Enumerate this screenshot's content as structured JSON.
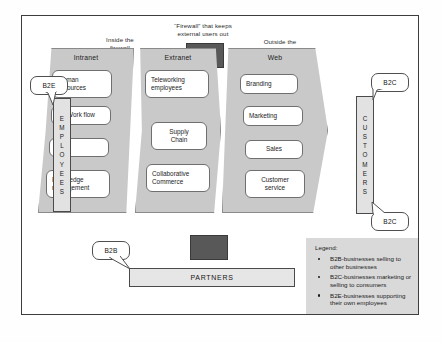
{
  "diagram": {
    "captions": {
      "inside": "Inside the\nfirewall",
      "inside_line1": "Inside the",
      "inside_line2": "firewall",
      "firewall_line1": "“Firewall” that keeps",
      "firewall_line2": "external users out",
      "outside_line1": "Outside the",
      "outside_line2": "firewall"
    },
    "columns": [
      {
        "id": "intranet",
        "title": "Intranet",
        "nodes": [
          "Human\nresources",
          "Work flow",
          "CRM",
          "Knowledge\nmanagement"
        ]
      },
      {
        "id": "extranet",
        "title": "Extranet",
        "nodes": [
          "Teleworking\nemployees",
          "Supply\nChain",
          "Collaborative\nCommerce"
        ]
      },
      {
        "id": "web",
        "title": "Web",
        "nodes": [
          "Branding",
          "Marketing",
          "Sales",
          "Customer\nservice"
        ]
      }
    ],
    "column_nodes": {
      "intranet": [
        {
          "line1": "Human",
          "line2": "resources"
        },
        {
          "line1": "Work flow",
          "line2": ""
        },
        {
          "line1": "CRM",
          "line2": ""
        },
        {
          "line1": "Knowledge",
          "line2": "management"
        }
      ],
      "extranet": [
        {
          "line1": "Teleworking",
          "line2": "employees"
        },
        {
          "line1": "Supply",
          "line2": "Chain"
        },
        {
          "line1": "Collaborative",
          "line2": "Commerce"
        }
      ],
      "web": [
        {
          "line1": "Branding",
          "line2": ""
        },
        {
          "line1": "Marketing",
          "line2": ""
        },
        {
          "line1": "Sales",
          "line2": ""
        },
        {
          "line1": "Customer",
          "line2": "service"
        }
      ]
    },
    "bars": {
      "employees": "EMPLOYEES",
      "customers": "CUSTOMERS",
      "partners": "PARTNERS"
    },
    "callouts": {
      "b2e": "B2E",
      "b2c_top": "B2C",
      "b2c_bottom": "B2C",
      "b2b": "B2B"
    },
    "legend": {
      "title": "Legend:",
      "items": [
        "B2B-businesses selling to other businesses",
        "B2C-businesses marketing or selling to consumers",
        "B2E-businesses supporting their own employees"
      ]
    },
    "colors": {
      "column_fill": "#c9c9c9",
      "firewall": "#585858",
      "legend_bg": "#d9d9d9",
      "bar_fill": "#e2e2e2",
      "node_fill": "#ffffff",
      "frame_border": "#3d3d3d"
    }
  }
}
